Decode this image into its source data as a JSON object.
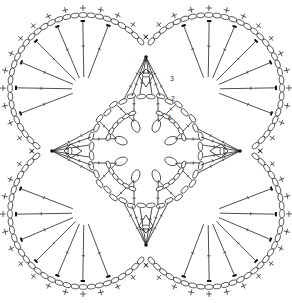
{
  "diagram": {
    "type": "crochet-chart",
    "colors": {
      "line": "#222222",
      "background": "#ffffff",
      "marker": "#111111"
    },
    "center": {
      "x": 146,
      "y": 151
    },
    "round_labels": [
      {
        "text": "1",
        "x": 168,
        "y": 120
      },
      {
        "text": "2",
        "x": 171,
        "y": 101
      },
      {
        "text": "3",
        "x": 170,
        "y": 81
      },
      {
        "text": "4",
        "x": 147,
        "y": 58
      }
    ],
    "symbols": {
      "chain": "oval",
      "single_crochet": "plus",
      "treble": "long-stitch-with-crossbar",
      "slip_stitch": "filled-dot"
    },
    "lobes": [
      "north-west",
      "north-east",
      "south-west",
      "south-east"
    ],
    "points": [
      "north",
      "east",
      "south",
      "west"
    ],
    "center_petals": 8
  }
}
